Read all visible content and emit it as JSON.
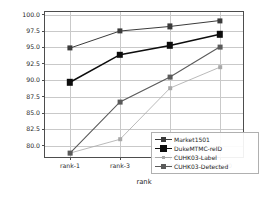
{
  "chart_data": {
    "type": "line",
    "title": "",
    "xlabel": "rank",
    "ylabel": "CMC(%)",
    "categories": [
      "rank-1",
      "rank-3",
      "rank-5",
      "rank-10"
    ],
    "x": [
      0,
      1,
      2,
      3
    ],
    "ylim": [
      78.0,
      100.4
    ],
    "yticks": [
      80.0,
      82.5,
      85.0,
      87.5,
      90.0,
      92.5,
      95.0,
      97.5,
      100.0
    ],
    "ytick_labels": [
      "80.0",
      "82.5",
      "85.0",
      "87.5",
      "90.0",
      "92.5",
      "95.0",
      "97.5",
      "100.0"
    ],
    "grid": true,
    "grid_color": "#c9c9c9",
    "legend_position": "lower right",
    "series": [
      {
        "name": "Market1501",
        "values": [
          94.9,
          97.5,
          98.2,
          99.1
        ],
        "color": "#3b3b3b",
        "marker": "square",
        "marker_size": 2.6,
        "line_width": 1.0
      },
      {
        "name": "DukeMTMC-reID",
        "values": [
          89.7,
          93.9,
          95.3,
          97.0
        ],
        "color": "#0d0d0d",
        "marker": "square",
        "marker_size": 3.2,
        "line_width": 1.5
      },
      {
        "name": "CUHK03-Label",
        "values": [
          78.9,
          81.0,
          88.8,
          92.0
        ],
        "color": "#a8a8a8",
        "marker": "square",
        "marker_size": 1.8,
        "line_width": 0.8
      },
      {
        "name": "CUHK03-Detected",
        "values": [
          78.9,
          86.7,
          90.5,
          95.1
        ],
        "color": "#5a5a5a",
        "marker": "square",
        "marker_size": 2.4,
        "line_width": 1.1
      }
    ]
  }
}
